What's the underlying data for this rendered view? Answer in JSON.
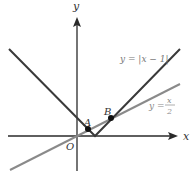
{
  "diagram": {
    "axes": {
      "x_label": "x",
      "y_label": "y",
      "origin_label": "O"
    },
    "curves": [
      {
        "name": "abs",
        "label_prefix": "y = |x − 1|",
        "color": "#3a3a3a"
      },
      {
        "name": "half",
        "label_prefix": "y = ",
        "label_num": "x",
        "label_den": "2",
        "color": "#8a8a8a"
      }
    ],
    "points": [
      {
        "label": "A",
        "desc": "intersection near vertex"
      },
      {
        "label": "B",
        "desc": "intersection on right branch"
      }
    ],
    "colors": {
      "axis": "#2a2a2a",
      "abs_line": "#3a3a3a",
      "half_line": "#8a8a8a",
      "label_gray": "#8a8a8a",
      "point": "#111111"
    }
  }
}
